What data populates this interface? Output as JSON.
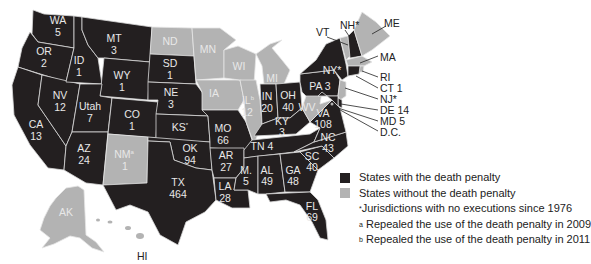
{
  "legend": {
    "with_dp": {
      "label": "States with the death penalty",
      "color": "#231f20"
    },
    "without_dp": {
      "label": "States without the death penalty",
      "color": "#b3b3b3"
    },
    "notes": [
      {
        "mark": "*",
        "text": "Jurisdictions with no executions since 1976"
      },
      {
        "mark": "a",
        "text": "Repealed the use of the death penalty in 2009"
      },
      {
        "mark": "b",
        "text": "Repealed the use of the death penalty in 2011"
      }
    ]
  },
  "states": {
    "WA": {
      "name": "WA",
      "value": "5",
      "status": "with"
    },
    "OR": {
      "name": "OR",
      "value": "2",
      "status": "with"
    },
    "CA": {
      "name": "CA",
      "value": "13",
      "status": "with"
    },
    "NV": {
      "name": "NV",
      "value": "12",
      "status": "with"
    },
    "ID": {
      "name": "ID",
      "value": "1",
      "status": "with"
    },
    "MT": {
      "name": "MT",
      "value": "3",
      "status": "with"
    },
    "WY": {
      "name": "WY",
      "value": "1",
      "status": "with"
    },
    "UT": {
      "name": "Utah",
      "value": "7",
      "status": "with"
    },
    "AZ": {
      "name": "AZ",
      "value": "24",
      "status": "with"
    },
    "CO": {
      "name": "CO",
      "value": "1",
      "status": "with"
    },
    "NM": {
      "name": "NM",
      "mark": "a",
      "value": "1",
      "status": "without"
    },
    "ND": {
      "name": "ND",
      "value": "",
      "status": "without"
    },
    "SD": {
      "name": "SD",
      "value": "1",
      "status": "with"
    },
    "NE": {
      "name": "NE",
      "value": "3",
      "status": "with"
    },
    "KS": {
      "name": "KS",
      "mark": "*",
      "value": "",
      "status": "with"
    },
    "OK": {
      "name": "OK",
      "value": "94",
      "status": "with"
    },
    "TX": {
      "name": "TX",
      "value": "464",
      "status": "with"
    },
    "MN": {
      "name": "MN",
      "value": "",
      "status": "without"
    },
    "IA": {
      "name": "IA",
      "value": "",
      "status": "without"
    },
    "MO": {
      "name": "MO",
      "value": "66",
      "status": "with"
    },
    "AR": {
      "name": "AR",
      "value": "27",
      "status": "with"
    },
    "LA": {
      "name": "LA",
      "value": "28",
      "status": "with"
    },
    "WI": {
      "name": "WI",
      "value": "",
      "status": "without"
    },
    "IL": {
      "name": "IL",
      "mark": "b",
      "value": "12",
      "status": "without"
    },
    "MI": {
      "name": "MI",
      "value": "",
      "status": "without"
    },
    "IN": {
      "name": "IN",
      "value": "20",
      "status": "with"
    },
    "OH": {
      "name": "OH",
      "value": "40",
      "status": "with"
    },
    "KY": {
      "name": "KY",
      "value": "3",
      "status": "with"
    },
    "TN": {
      "name": "TN",
      "value": "4",
      "status": "with"
    },
    "MS": {
      "name": "M.",
      "value": "5",
      "status": "with"
    },
    "AL": {
      "name": "AL",
      "value": "49",
      "status": "with"
    },
    "GA": {
      "name": "GA",
      "value": "48",
      "status": "with"
    },
    "FL": {
      "name": "FL",
      "value": "69",
      "status": "with"
    },
    "SC": {
      "name": "SC",
      "value": "40",
      "status": "with"
    },
    "NC": {
      "name": "NC",
      "value": "43",
      "status": "with"
    },
    "VA": {
      "name": "VA",
      "value": "108",
      "status": "with"
    },
    "WV": {
      "name": "WV",
      "value": "",
      "status": "without"
    },
    "PA": {
      "name": "PA",
      "value": "3",
      "status": "with"
    },
    "NY": {
      "name": "NY",
      "mark": "*",
      "value": "",
      "status": "with"
    },
    "VT": {
      "name": "VT",
      "value": "",
      "status": "without"
    },
    "NH": {
      "name": "NH",
      "mark": "*",
      "value": "",
      "status": "with"
    },
    "ME": {
      "name": "ME",
      "value": "",
      "status": "without"
    },
    "MA": {
      "name": "MA",
      "value": "",
      "status": "without"
    },
    "RI": {
      "name": "RI",
      "value": "",
      "status": "without"
    },
    "CT": {
      "name": "CT",
      "value": "1",
      "status": "with"
    },
    "NJ": {
      "name": "NJ",
      "mark": "*",
      "value": "",
      "status": "without"
    },
    "DE": {
      "name": "DE",
      "value": "14",
      "status": "with"
    },
    "MD": {
      "name": "MD",
      "value": "5",
      "status": "with"
    },
    "DC": {
      "name": "D.C.",
      "value": "",
      "status": "without"
    },
    "AK": {
      "name": "AK",
      "value": "",
      "status": "without"
    },
    "HI": {
      "name": "HI",
      "value": "",
      "status": "without"
    }
  },
  "labels": {
    "WA": "WA",
    "WA_v": "5",
    "OR": "OR",
    "OR_v": "2",
    "CA": "CA",
    "CA_v": "13",
    "NV": "NV",
    "NV_v": "12",
    "ID": "ID",
    "ID_v": "1",
    "MT": "MT",
    "MT_v": "3",
    "WY": "WY",
    "WY_v": "1",
    "UT": "Utah",
    "UT_v": "7",
    "AZ": "AZ",
    "AZ_v": "24",
    "CO": "CO",
    "CO_v": "1",
    "NM": "NM",
    "NM_m": "a",
    "NM_v": "1",
    "ND": "ND",
    "SD": "SD",
    "SD_v": "1",
    "NE": "NE",
    "NE_v": "3",
    "KS": "KS",
    "KS_m": "*",
    "OK": "OK",
    "OK_v": "94",
    "TX": "TX",
    "TX_v": "464",
    "MN": "MN",
    "IA": "IA",
    "MO": "MO",
    "MO_v": "66",
    "AR": "AR",
    "AR_v": "27",
    "LA": "LA",
    "LA_v": "28",
    "WI": "WI",
    "IL": "IL",
    "IL_m": "b",
    "IL_v": "12",
    "MI": "MI",
    "IN": "IN",
    "IN_v": "20",
    "OH": "OH",
    "OH_v": "40",
    "KY": "KY",
    "KY_v": "3",
    "TN": "TN 4",
    "MS": "M.",
    "MS_v": "5",
    "AL": "AL",
    "AL_v": "49",
    "GA": "GA",
    "GA_v": "48",
    "FL": "FL",
    "FL_v": "69",
    "SC": "SC",
    "SC_v": "40",
    "NC": "NC",
    "NC_v": "43",
    "VA": "VA",
    "VA_v": "108",
    "WV": "WV",
    "PA": "PA 3",
    "NY": "NY*",
    "VT": "VT",
    "NH": "NH*",
    "ME": "ME",
    "MA": "MA",
    "RI": "RI",
    "CT": "CT 1",
    "NJ": "NJ*",
    "DE": "DE 14",
    "MD": "MD 5",
    "DC": "D.C.",
    "AK": "AK",
    "HI": "HI"
  }
}
